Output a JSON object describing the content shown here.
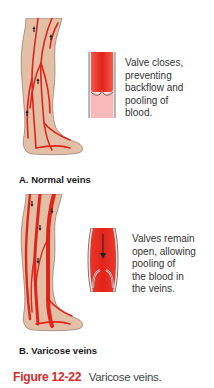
{
  "figure": {
    "number": "Figure 12-22",
    "title": "Varicose veins.",
    "number_color": "#d42a2a"
  },
  "panels": [
    {
      "label": "A. Normal veins",
      "description_lines": [
        "Valve closes,",
        "preventing",
        "backflow and",
        "pooling of",
        "blood."
      ],
      "flow_direction": "up",
      "valve_state": "closed"
    },
    {
      "label": "B. Varicose veins",
      "description_lines": [
        "Valves remain",
        "open, allowing",
        "pooling of",
        "the blood in",
        "the veins."
      ],
      "flow_direction": "down",
      "valve_state": "open"
    }
  ],
  "colors": {
    "skin": "#e3bfa5",
    "skin_outline": "#9b8070",
    "vein": "#e2231a",
    "vessel_light": "#f7b9b9"
  }
}
